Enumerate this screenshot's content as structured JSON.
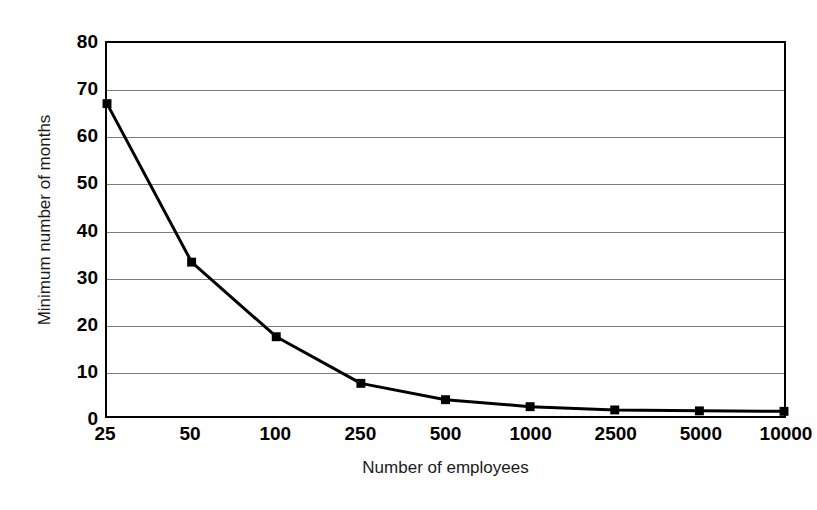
{
  "chart_data": {
    "type": "line",
    "title": "",
    "xlabel": "Number of employees",
    "ylabel": "Minimum number of months",
    "categories": [
      "25",
      "50",
      "100",
      "250",
      "500",
      "1000",
      "2500",
      "5000",
      "10000"
    ],
    "values": [
      67,
      33,
      17,
      7,
      3.5,
      2,
      1.3,
      1.1,
      1
    ],
    "series": [
      {
        "name": "Minimum number of months",
        "values": [
          67,
          33,
          17,
          7,
          3.5,
          2,
          1.3,
          1.1,
          1
        ]
      }
    ],
    "ylim": [
      0,
      80
    ],
    "y_ticks": [
      0,
      10,
      20,
      30,
      40,
      50,
      60,
      70,
      80
    ],
    "y_tick_labels": [
      "0",
      "10",
      "20",
      "30",
      "40",
      "50",
      "60",
      "70",
      "80"
    ],
    "x_tick_labels": [
      "25",
      "50",
      "100",
      "250",
      "500",
      "1000",
      "2500",
      "5000",
      "10000"
    ],
    "grid": "horizontal",
    "legend": "none",
    "marker": "square",
    "line_color": "#000000",
    "marker_color": "#000000",
    "gridline_color": "#7d7d7d",
    "axis_color": "#000000",
    "background_color": "#ffffff"
  }
}
